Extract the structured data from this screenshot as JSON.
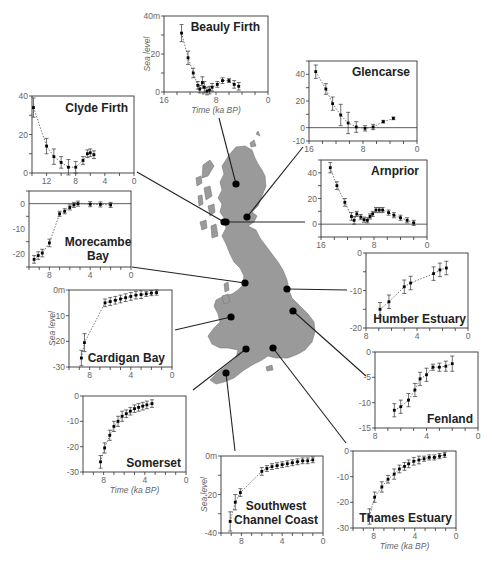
{
  "figure": {
    "map_fill": "#9a9a9a",
    "map_stroke": "#7a7a7a",
    "point_color": "#000000",
    "line_color": "#222222",
    "tick_label_color": "#666666",
    "axis_title_color": "#666666",
    "x_axis_title": "Time (ka BP)",
    "y_axis_title": "Sea level"
  },
  "chart_data": [
    {
      "id": "beauly",
      "title": "Beauly Firth",
      "type": "scatter",
      "box": {
        "x": 164,
        "y": 16,
        "w": 104,
        "h": 76
      },
      "xlim": [
        16,
        0
      ],
      "ylim": [
        0,
        40
      ],
      "xticks": [
        16,
        8,
        0
      ],
      "xtick_labels": [
        "16",
        "8",
        "0"
      ],
      "yticks": [
        0,
        20,
        40
      ],
      "ytick_labels": [
        "0",
        "20",
        "40m"
      ],
      "ylabel": "Sea level",
      "xlabel": "Time (ka BP)",
      "zero_line": false,
      "title_pos": {
        "x": 260,
        "y": 31,
        "anchor": "end"
      },
      "site": {
        "x": 236,
        "y": 184
      },
      "leader_from": {
        "x": 219,
        "y": 118
      },
      "points": [
        [
          13.3,
          31,
          4.5
        ],
        [
          12.3,
          18,
          3.5
        ],
        [
          11.5,
          10,
          2.5
        ],
        [
          10.8,
          3.5,
          2
        ],
        [
          10.5,
          1.5,
          2
        ],
        [
          10.1,
          5,
          3
        ],
        [
          9.8,
          2.5,
          3
        ],
        [
          9.4,
          0.5,
          2
        ],
        [
          9,
          1,
          2
        ],
        [
          8.6,
          2.5,
          2
        ],
        [
          7.8,
          4,
          1.5
        ],
        [
          7,
          6,
          1.5
        ],
        [
          6,
          6,
          1
        ],
        [
          5.2,
          4,
          2
        ],
        [
          4.5,
          3,
          2
        ]
      ]
    },
    {
      "id": "glencarse",
      "title": "Glencarse",
      "type": "scatter",
      "box": {
        "x": 309,
        "y": 61,
        "w": 108,
        "h": 80
      },
      "xlim": [
        16,
        0
      ],
      "ylim": [
        -10,
        50
      ],
      "xticks": [
        16,
        8,
        0
      ],
      "xtick_labels": [
        "16",
        "8",
        "0"
      ],
      "yticks": [
        -10,
        0,
        20,
        40
      ],
      "ytick_labels": [
        "-10",
        "0",
        "20",
        "40"
      ],
      "ylabel": "",
      "xlabel": "",
      "zero_line": true,
      "title_pos": {
        "x": 410,
        "y": 76,
        "anchor": "end"
      },
      "site": {
        "x": 247,
        "y": 217
      },
      "leader_from": {
        "x": 303,
        "y": 147
      },
      "points": [
        [
          15,
          42,
          5
        ],
        [
          13.5,
          29,
          4
        ],
        [
          12.5,
          18,
          5
        ],
        [
          11.3,
          9.5,
          8
        ],
        [
          10.2,
          3.5,
          8
        ],
        [
          9,
          0.5,
          4
        ],
        [
          7.7,
          -0.5,
          2
        ],
        [
          6.5,
          0.5,
          2
        ],
        [
          5,
          4.5,
          1
        ],
        [
          3.5,
          7,
          1
        ]
      ]
    },
    {
      "id": "clyde",
      "title": "Clyde Firth",
      "type": "scatter",
      "box": {
        "x": 32,
        "y": 96,
        "w": 102,
        "h": 77
      },
      "xlim": [
        14,
        0
      ],
      "ylim": [
        0,
        40
      ],
      "xticks": [
        12,
        8,
        4,
        0
      ],
      "xtick_labels": [
        "12",
        "8",
        "4",
        "0"
      ],
      "yticks": [
        0,
        20,
        40
      ],
      "ytick_labels": [
        "0",
        "20",
        "40"
      ],
      "ylabel": "",
      "xlabel": "",
      "zero_line": false,
      "title_pos": {
        "x": 128,
        "y": 112,
        "anchor": "end"
      },
      "site": {
        "x": 224,
        "y": 222
      },
      "leader_from": {
        "x": 137,
        "y": 172
      },
      "points": [
        [
          13.8,
          34,
          5
        ],
        [
          12,
          14,
          4
        ],
        [
          11,
          8.5,
          4
        ],
        [
          10,
          5.5,
          3
        ],
        [
          9,
          3,
          4
        ],
        [
          8,
          3,
          3
        ],
        [
          7,
          6.5,
          2
        ],
        [
          6.4,
          10,
          2
        ],
        [
          6,
          10.5,
          2
        ],
        [
          5.5,
          9.5,
          2
        ]
      ]
    },
    {
      "id": "arnprior",
      "title": "Arnprior",
      "type": "scatter",
      "box": {
        "x": 321,
        "y": 160,
        "w": 106,
        "h": 77
      },
      "xlim": [
        16,
        0
      ],
      "ylim": [
        -10,
        50
      ],
      "xticks": [
        16,
        8,
        0
      ],
      "xtick_labels": [
        "16",
        "8",
        "0"
      ],
      "yticks": [
        0,
        20,
        40
      ],
      "ytick_labels": [
        "0",
        "20",
        "40"
      ],
      "ylabel": "",
      "xlabel": "",
      "zero_line": true,
      "title_pos": {
        "x": 419,
        "y": 175,
        "anchor": "end"
      },
      "site": {
        "x": 226,
        "y": 222
      },
      "leader_from": {
        "x": 305,
        "y": 222
      },
      "points": [
        [
          14.6,
          44,
          4
        ],
        [
          13.6,
          30,
          3
        ],
        [
          12.4,
          17,
          3
        ],
        [
          11.4,
          6,
          3
        ],
        [
          11,
          3,
          3
        ],
        [
          10.6,
          8,
          2
        ],
        [
          10,
          5.5,
          2
        ],
        [
          9.5,
          3.5,
          2
        ],
        [
          9,
          3,
          2
        ],
        [
          8.6,
          6,
          2
        ],
        [
          8.2,
          8,
          2
        ],
        [
          7.7,
          11,
          2
        ],
        [
          7.2,
          11,
          2
        ],
        [
          6.7,
          11,
          2
        ],
        [
          5.8,
          9,
          2
        ],
        [
          5,
          7,
          2
        ],
        [
          4,
          5,
          2
        ],
        [
          3,
          3,
          2
        ],
        [
          2,
          1,
          2
        ]
      ]
    },
    {
      "id": "morecambe",
      "title": "Morecambe Bay",
      "title_lines": [
        "Morecambe",
        "Bay"
      ],
      "type": "scatter",
      "box": {
        "x": 29,
        "y": 191,
        "w": 102,
        "h": 76
      },
      "xlim": [
        10,
        0
      ],
      "ylim": [
        -25,
        5
      ],
      "xticks": [
        8,
        4,
        0
      ],
      "xtick_labels": [
        "8",
        "4",
        "0"
      ],
      "yticks": [
        -20,
        -10,
        0
      ],
      "ytick_labels": [
        "-20",
        "-10",
        "0"
      ],
      "ylabel": "",
      "xlabel": "",
      "zero_line": true,
      "title_pos": {
        "x": 98,
        "y": 246,
        "anchor": "middle"
      },
      "site": {
        "x": 245,
        "y": 283
      },
      "leader_from": {
        "x": 132,
        "y": 267
      },
      "points": [
        [
          9.5,
          -22,
          1.5
        ],
        [
          9.1,
          -20.5,
          1.5
        ],
        [
          8.7,
          -19.5,
          1.5
        ],
        [
          8,
          -15.5,
          1.5
        ],
        [
          7,
          -4,
          1
        ],
        [
          6.5,
          -3,
          1
        ],
        [
          6,
          -1.5,
          1
        ],
        [
          5.6,
          -0.5,
          1
        ],
        [
          5.2,
          0,
          1
        ],
        [
          4,
          -0.2,
          1
        ],
        [
          3,
          -0.3,
          1
        ],
        [
          2,
          -0.5,
          1
        ]
      ]
    },
    {
      "id": "humber",
      "title": "Humber Estuary",
      "type": "scatter",
      "box": {
        "x": 366,
        "y": 253,
        "w": 102,
        "h": 75
      },
      "xlim": [
        8,
        0
      ],
      "ylim": [
        -20,
        0
      ],
      "xticks": [
        8,
        4,
        0
      ],
      "xtick_labels": [
        "8",
        "4",
        "0"
      ],
      "yticks": [
        -20,
        -10,
        0
      ],
      "ytick_labels": [
        "-20",
        "-10",
        "0"
      ],
      "ylabel": "",
      "xlabel": "",
      "zero_line": false,
      "title_pos": {
        "x": 466,
        "y": 323,
        "anchor": "end"
      },
      "site": {
        "x": 287,
        "y": 289
      },
      "leader_from": {
        "x": 347,
        "y": 290
      },
      "points": [
        [
          6.9,
          -15,
          1.8
        ],
        [
          6.2,
          -13,
          1.8
        ],
        [
          5,
          -9,
          1.8
        ],
        [
          4.5,
          -8,
          1.8
        ],
        [
          2.7,
          -5.5,
          1.8
        ],
        [
          2.2,
          -4.5,
          1.8
        ],
        [
          1.7,
          -4,
          1.8
        ]
      ]
    },
    {
      "id": "cardigan",
      "title": "Cardigan Bay",
      "type": "scatter",
      "box": {
        "x": 69,
        "y": 290,
        "w": 103,
        "h": 77
      },
      "xlim": [
        10,
        0
      ],
      "ylim": [
        -30,
        0
      ],
      "xticks": [
        8,
        4,
        0
      ],
      "xtick_labels": [
        "8",
        "4",
        "0"
      ],
      "yticks": [
        -30,
        -20,
        -10,
        0
      ],
      "ytick_labels": [
        "-30",
        "-20",
        "-10",
        "0m"
      ],
      "ylabel": "Sea level",
      "xlabel": "",
      "zero_line": false,
      "title_pos": {
        "x": 165,
        "y": 362,
        "anchor": "end"
      },
      "site": {
        "x": 231,
        "y": 317
      },
      "leader_from": {
        "x": 175,
        "y": 330
      },
      "points": [
        [
          8.8,
          -26.5,
          3
        ],
        [
          8.5,
          -20.5,
          3.5
        ],
        [
          6.5,
          -5,
          1.5
        ],
        [
          6,
          -4.5,
          1.5
        ],
        [
          5.5,
          -4,
          1.5
        ],
        [
          5,
          -3.5,
          1.5
        ],
        [
          4.5,
          -3,
          1.5
        ],
        [
          4,
          -2.5,
          1.5
        ],
        [
          3.5,
          -2,
          1.5
        ],
        [
          3,
          -1.8,
          1.5
        ],
        [
          2.5,
          -1.5,
          1
        ],
        [
          2,
          -1.2,
          1
        ],
        [
          1.5,
          -1,
          1
        ]
      ]
    },
    {
      "id": "fenland",
      "title": "Fenland",
      "type": "scatter",
      "box": {
        "x": 375,
        "y": 352,
        "w": 103,
        "h": 76
      },
      "xlim": [
        8,
        0
      ],
      "ylim": [
        -15,
        0
      ],
      "xticks": [
        8,
        4,
        0
      ],
      "xtick_labels": [
        "8",
        "4",
        "0"
      ],
      "yticks": [
        -15,
        -10,
        -5,
        0
      ],
      "ytick_labels": [
        "-15",
        "-10",
        "-5",
        "0"
      ],
      "ylabel": "",
      "xlabel": "",
      "zero_line": false,
      "title_pos": {
        "x": 473,
        "y": 423,
        "anchor": "end"
      },
      "site": {
        "x": 293,
        "y": 311
      },
      "leader_from": {
        "x": 366,
        "y": 376
      },
      "points": [
        [
          6.5,
          -11.5,
          1.3
        ],
        [
          6,
          -10.8,
          1.3
        ],
        [
          5.4,
          -9.5,
          1.3
        ],
        [
          4.9,
          -7.5,
          1.3
        ],
        [
          4.5,
          -5.3,
          1.3
        ],
        [
          4,
          -4.5,
          1.3
        ],
        [
          3.5,
          -3,
          0.6
        ],
        [
          3,
          -3,
          0.8
        ],
        [
          2.5,
          -2.8,
          1
        ],
        [
          2,
          -2.3,
          1.5
        ]
      ]
    },
    {
      "id": "somerset",
      "title": "Somerset",
      "type": "scatter",
      "box": {
        "x": 83,
        "y": 396,
        "w": 103,
        "h": 76
      },
      "xlim": [
        10,
        0
      ],
      "ylim": [
        -30,
        0
      ],
      "xticks": [
        8,
        4,
        0
      ],
      "xtick_labels": [
        "8",
        "4",
        "0"
      ],
      "yticks": [
        -30,
        -20,
        -10,
        0
      ],
      "ytick_labels": [
        "-30",
        "-20",
        "-10",
        "0"
      ],
      "ylabel": "",
      "xlabel": "Time (ka BP)",
      "zero_line": false,
      "title_pos": {
        "x": 181,
        "y": 467,
        "anchor": "end"
      },
      "site": {
        "x": 246,
        "y": 349
      },
      "leader_from": {
        "x": 193,
        "y": 390
      },
      "points": [
        [
          8.3,
          -26,
          2.5
        ],
        [
          7.9,
          -20.5,
          2
        ],
        [
          7.4,
          -15.5,
          2
        ],
        [
          7,
          -12,
          2
        ],
        [
          6.6,
          -10,
          2
        ],
        [
          6.2,
          -8,
          2
        ],
        [
          5.8,
          -7,
          1.5
        ],
        [
          5.4,
          -6,
          1.5
        ],
        [
          5,
          -5,
          1.5
        ],
        [
          4.6,
          -4.5,
          1.5
        ],
        [
          4.2,
          -4,
          1.5
        ],
        [
          3.8,
          -3.5,
          1.5
        ],
        [
          3.3,
          -3,
          1.5
        ]
      ]
    },
    {
      "id": "southwest",
      "title": "Southwest Channel Coast",
      "title_lines": [
        "Southwest",
        "Channel Coast"
      ],
      "type": "scatter",
      "box": {
        "x": 221,
        "y": 456,
        "w": 102,
        "h": 77
      },
      "xlim": [
        10,
        0
      ],
      "ylim": [
        -40,
        0
      ],
      "xticks": [
        8,
        4,
        0
      ],
      "xtick_labels": [
        "8",
        "4",
        "0"
      ],
      "yticks": [
        -40,
        -20,
        0
      ],
      "ytick_labels": [
        "-40",
        "-20",
        "0m"
      ],
      "ylabel": "Sea level",
      "xlabel": "",
      "zero_line": false,
      "title_pos": {
        "x": 276,
        "y": 510,
        "anchor": "middle"
      },
      "site": {
        "x": 226,
        "y": 373
      },
      "leader_from": {
        "x": 235,
        "y": 451
      },
      "points": [
        [
          9.1,
          -34,
          5
        ],
        [
          8.6,
          -24,
          4
        ],
        [
          8.1,
          -19,
          2
        ],
        [
          6,
          -8,
          2
        ],
        [
          5.5,
          -6.5,
          1.5
        ],
        [
          5,
          -5.5,
          1.5
        ],
        [
          4.5,
          -5,
          1.5
        ],
        [
          4,
          -4.5,
          1.5
        ],
        [
          3.5,
          -4,
          1.5
        ],
        [
          3,
          -3.5,
          1.5
        ],
        [
          2.5,
          -3,
          1.5
        ],
        [
          2,
          -2.5,
          1.5
        ],
        [
          1.5,
          -2.5,
          1.5
        ],
        [
          1,
          -2,
          1.5
        ]
      ]
    },
    {
      "id": "thames",
      "title": "Thames Estuary",
      "type": "scatter",
      "box": {
        "x": 353,
        "y": 451,
        "w": 103,
        "h": 77
      },
      "xlim": [
        10,
        0
      ],
      "ylim": [
        -30,
        0
      ],
      "xticks": [
        8,
        4,
        0
      ],
      "xtick_labels": [
        "8",
        "4",
        "0"
      ],
      "yticks": [
        -30,
        -20,
        -10,
        0
      ],
      "ytick_labels": [
        "-30",
        "-20",
        "-10",
        "0"
      ],
      "ylabel": "",
      "xlabel": "Time (ka BP)",
      "zero_line": false,
      "title_pos": {
        "x": 452,
        "y": 522,
        "anchor": "end"
      },
      "site": {
        "x": 273,
        "y": 348
      },
      "leader_from": {
        "x": 346,
        "y": 443
      },
      "points": [
        [
          8.4,
          -25.5,
          3
        ],
        [
          7.9,
          -18,
          2
        ],
        [
          7.2,
          -14,
          2
        ],
        [
          6.6,
          -11,
          1.5
        ],
        [
          6,
          -9,
          2
        ],
        [
          5.5,
          -7,
          1.5
        ],
        [
          5,
          -6,
          1.5
        ],
        [
          4.6,
          -5,
          1.5
        ],
        [
          4.1,
          -4,
          1.5
        ],
        [
          3.6,
          -3.5,
          1.5
        ],
        [
          3.1,
          -3,
          1
        ],
        [
          2.6,
          -2.5,
          1
        ],
        [
          2.1,
          -2.5,
          1
        ],
        [
          1.6,
          -2,
          1
        ],
        [
          1.1,
          -1.5,
          1
        ]
      ]
    }
  ]
}
